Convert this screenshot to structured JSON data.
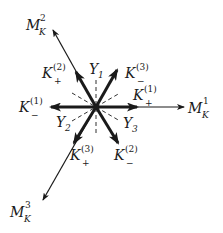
{
  "diagram": {
    "center": {
      "x": 96,
      "y": 107
    },
    "colors": {
      "stroke": "#1a1a1a",
      "background": "#ffffff"
    },
    "long_arrows": [
      {
        "id": "M_K^1",
        "base": "M",
        "sub": "K",
        "sup": "1",
        "tip": [
          184,
          107
        ]
      },
      {
        "id": "M_K^2",
        "base": "M",
        "sub": "K",
        "sup": "2",
        "tip": [
          53,
          30
        ]
      },
      {
        "id": "M_K^3",
        "base": "M",
        "sub": "K",
        "sup": "3",
        "tip": [
          43,
          200
        ]
      }
    ],
    "thick_arrows": [
      {
        "id": "K_+^(1)",
        "base": "K",
        "sub": "+",
        "sup": "(1)",
        "tip": [
          137,
          107
        ]
      },
      {
        "id": "K_-^(1)",
        "base": "K",
        "sub": "−",
        "sup": "(1)",
        "tip": [
          51,
          107
        ]
      },
      {
        "id": "K_+^(2)",
        "base": "K",
        "sub": "+",
        "sup": "(2)",
        "tip": [
          76,
          72
        ]
      },
      {
        "id": "K_-^(2)",
        "base": "K",
        "sub": "−",
        "sup": "(2)",
        "tip": [
          118,
          143
        ]
      },
      {
        "id": "K_+^(3)",
        "base": "K",
        "sub": "+",
        "sup": "(3)",
        "tip": [
          74,
          143
        ]
      },
      {
        "id": "K_-^(3)",
        "base": "K",
        "sub": "−",
        "sup": "(3)",
        "tip": [
          117,
          70
        ]
      }
    ],
    "dashed_axes": [
      {
        "id": "Y_1",
        "base": "Y",
        "sub": "1",
        "from": [
          96,
          80
        ],
        "to": [
          96,
          135
        ]
      },
      {
        "id": "Y_2",
        "base": "Y",
        "sub": "2",
        "from": [
          72,
          121
        ],
        "to": [
          120,
          93
        ]
      },
      {
        "id": "Y_3",
        "base": "Y",
        "sub": "3",
        "from": [
          72,
          93
        ],
        "to": [
          120,
          121
        ]
      }
    ],
    "labels": {
      "M1": {
        "base": "M",
        "sub": "K",
        "sup": "1"
      },
      "M2": {
        "base": "M",
        "sub": "K",
        "sup": "2"
      },
      "M3": {
        "base": "M",
        "sub": "K",
        "sup": "3"
      },
      "Kp1": {
        "base": "K",
        "sub": "+",
        "sup": "(1)"
      },
      "Km1": {
        "base": "K",
        "sub": "−",
        "sup": "(1)"
      },
      "Kp2": {
        "base": "K",
        "sub": "+",
        "sup": "(2)"
      },
      "Km2": {
        "base": "K",
        "sub": "−",
        "sup": "(2)"
      },
      "Kp3": {
        "base": "K",
        "sub": "+",
        "sup": "(3)"
      },
      "Km3": {
        "base": "K",
        "sub": "−",
        "sup": "(3)"
      },
      "Y1": {
        "base": "Y",
        "sub": "1"
      },
      "Y2": {
        "base": "Y",
        "sub": "2"
      },
      "Y3": {
        "base": "Y",
        "sub": "3"
      }
    }
  }
}
